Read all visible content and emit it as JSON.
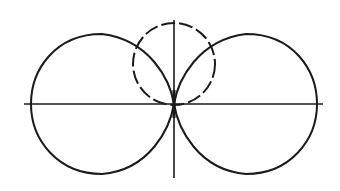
{
  "diagram": {
    "colors": {
      "stroke": "#1a1a1a",
      "background": "#ffffff"
    },
    "axes": {
      "horizontal": {
        "x1": 24,
        "x2": 323,
        "y": 104
      },
      "vertical": {
        "x": 174,
        "y1": 20,
        "y2": 178
      }
    },
    "origin": {
      "x": 174,
      "y": 104
    },
    "lobes": [
      {
        "name": "left-lobe",
        "style": "solid",
        "left_x": 31,
        "top_y": 34,
        "bottom_y": 174
      },
      {
        "name": "right-lobe",
        "style": "solid",
        "right_x": 317,
        "top_y": 34,
        "bottom_y": 174
      }
    ],
    "dashed_circle": {
      "cx": 174,
      "cy": 64,
      "r": 41,
      "style": "dashed"
    }
  }
}
